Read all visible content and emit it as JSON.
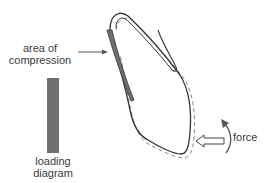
{
  "labels": {
    "compression_line1": "area of",
    "compression_line2": "compression",
    "loading_line1": "loading",
    "loading_line2": "diagram",
    "force": "force"
  },
  "colors": {
    "outline": "#333333",
    "dashed_outline": "#8a8a8a",
    "compression_fill": "#6f6f6f",
    "loading_bar": "#6f6f6f",
    "text": "#3a3a3a"
  },
  "elements": [
    "tooth-outline",
    "tooth-dashed-displaced-outline",
    "compression-zone",
    "compression-pointer-arrow",
    "loading-diagram-bar",
    "force-arrow",
    "rotation-arrow",
    "lip-curve"
  ]
}
